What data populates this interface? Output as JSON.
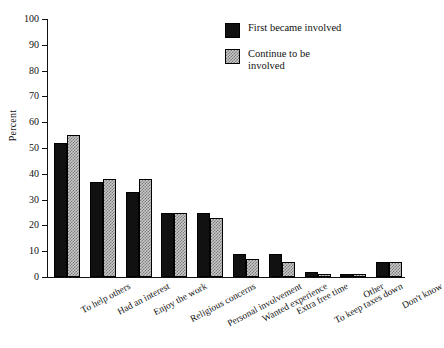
{
  "chart_data": {
    "type": "bar",
    "title": "",
    "xlabel": "",
    "ylabel": "Percent",
    "ylim": [
      0,
      100
    ],
    "yticks": [
      0,
      10,
      20,
      30,
      40,
      50,
      60,
      70,
      80,
      90,
      100
    ],
    "grid": false,
    "legend_position": "top-right",
    "categories": [
      "To help others",
      "Had an interest",
      "Enjoy the work",
      "Religious concerns",
      "Personal involvement",
      "Wanted experience",
      "Extra free time",
      "To keep taxes down",
      "Other",
      "Don't know"
    ],
    "series": [
      {
        "name": "First became involved",
        "color": "#111111",
        "values": [
          52,
          37,
          33,
          25,
          25,
          9,
          9,
          2,
          1,
          6
        ]
      },
      {
        "name": "Continue to be involved",
        "color": "#c9c9c9",
        "values": [
          55,
          38,
          38,
          25,
          23,
          7,
          6,
          1,
          1,
          6
        ]
      }
    ]
  },
  "legend": {
    "items": [
      {
        "label": "First became involved"
      },
      {
        "label": "Continue to be involved"
      }
    ]
  }
}
